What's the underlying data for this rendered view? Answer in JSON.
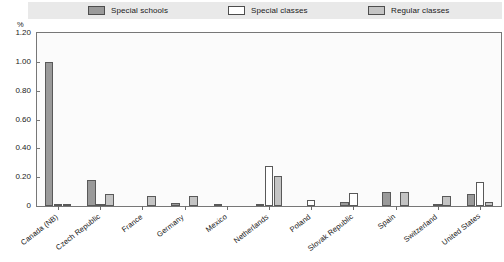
{
  "legend": {
    "items": [
      {
        "label": "Special schools",
        "color": "#9a9a9a",
        "icon": "legend-swatch"
      },
      {
        "label": "Special classes",
        "color": "#ffffff",
        "icon": "legend-swatch"
      },
      {
        "label": "Regular classes",
        "color": "#c4c4c4",
        "icon": "legend-swatch"
      }
    ]
  },
  "axis": {
    "unit_label": "%",
    "y_ticks": [
      "1.20",
      "1.00",
      "0.80",
      "0.60",
      "0.40",
      "0.20",
      "0"
    ]
  },
  "chart_data": {
    "type": "bar",
    "title": "",
    "subtitle": "",
    "xlabel": "",
    "ylabel": "%",
    "ylim": [
      0,
      1.2
    ],
    "ytick_values": [
      0,
      0.2,
      0.4,
      0.6,
      0.8,
      1.0,
      1.2
    ],
    "grid": false,
    "legend_position": "top",
    "categories": [
      "Canada (NB)",
      "Czech Republic",
      "France",
      "Germany",
      "Mexico",
      "Netherlands",
      "Poland",
      "Slovak Republic",
      "Spain",
      "Switzerland",
      "United States"
    ],
    "series": [
      {
        "name": "Special schools",
        "color": "#9a9a9a",
        "values": [
          1.0,
          0.18,
          0.0,
          0.02,
          0.01,
          0.01,
          0.0,
          0.03,
          0.1,
          0.0,
          0.08
        ]
      },
      {
        "name": "Special classes",
        "color": "#ffffff",
        "values": [
          0.01,
          0.01,
          0.0,
          0.0,
          0.0,
          0.28,
          0.04,
          0.09,
          0.0,
          0.01,
          0.17
        ]
      },
      {
        "name": "Regular classes",
        "color": "#c4c4c4",
        "values": [
          0.01,
          0.08,
          0.07,
          0.07,
          0.0,
          0.21,
          0.0,
          0.0,
          0.1,
          0.07,
          0.03
        ]
      }
    ]
  }
}
